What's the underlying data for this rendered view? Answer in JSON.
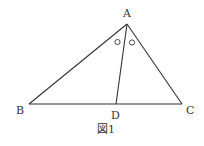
{
  "figure": {
    "caption": "図1",
    "points": {
      "A": {
        "label": "A"
      },
      "B": {
        "label": "B"
      },
      "C": {
        "label": "C"
      },
      "D": {
        "label": "D"
      }
    },
    "segments": [
      "AB",
      "AC",
      "BC",
      "AD"
    ],
    "angle_marks": {
      "symbol": "○",
      "meaning": "∠BAD = ∠DAC (AD bisects angle A)"
    }
  }
}
